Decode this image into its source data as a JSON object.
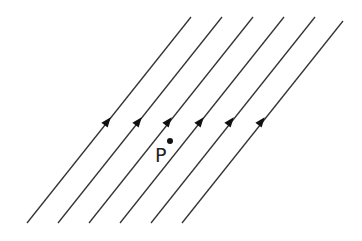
{
  "diagram": {
    "title": "",
    "line_color": "#333333",
    "field_lines": [
      {
        "x1": 27,
        "y1": 223,
        "x2": 191,
        "y2": 17,
        "arrow_x": 107,
        "arrow_y": 122
      },
      {
        "x1": 58,
        "y1": 223,
        "x2": 222,
        "y2": 17,
        "arrow_x": 138,
        "arrow_y": 122
      },
      {
        "x1": 89,
        "y1": 223,
        "x2": 253,
        "y2": 17,
        "arrow_x": 168,
        "arrow_y": 122
      },
      {
        "x1": 120,
        "y1": 223,
        "x2": 284,
        "y2": 17,
        "arrow_x": 200,
        "arrow_y": 122
      },
      {
        "x1": 151,
        "y1": 223,
        "x2": 315,
        "y2": 17,
        "arrow_x": 230,
        "arrow_y": 122
      },
      {
        "x1": 182,
        "y1": 223,
        "x2": 343,
        "y2": 21,
        "arrow_x": 261,
        "arrow_y": 122
      }
    ],
    "point": {
      "label": "P",
      "dot_x": 170,
      "dot_y": 141,
      "label_x": 155,
      "label_y": 146
    }
  }
}
